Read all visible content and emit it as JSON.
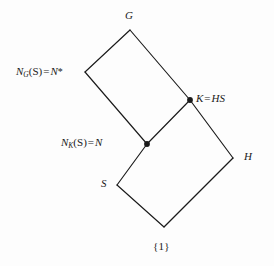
{
  "figure": {
    "type": "subgroup-lattice-diagram",
    "background_color": "#fdfdfd",
    "line_color": "#1a1a1a",
    "text_color": "#1a1a1a",
    "width": 274,
    "height": 266
  },
  "nodes": {
    "top": {
      "id": "G",
      "label": "G",
      "x": 130,
      "y": 30,
      "dot": false
    },
    "upper_left": {
      "id": "N_G_S",
      "label_prefix": "N",
      "label_subscript": "G",
      "label_arg": "(S)",
      "label_operator": "=",
      "label_value": "N",
      "label_star": "*",
      "label_full": "N_G(S) = N*",
      "x": 85,
      "y": 72,
      "dot": false
    },
    "right_upper": {
      "id": "K",
      "label_left": "K",
      "label_operator": "=",
      "label_right": "HS",
      "label_full": "K = HS",
      "x": 190,
      "y": 100,
      "dot": true
    },
    "center": {
      "id": "N_K_S",
      "label_prefix": "N",
      "label_subscript": "K",
      "label_arg": "(S)",
      "label_operator": "=",
      "label_value": "N",
      "label_full": "N_K(S) = N",
      "x": 147,
      "y": 144,
      "dot": true
    },
    "right_lower": {
      "id": "H",
      "label": "H",
      "x": 233,
      "y": 158,
      "dot": false
    },
    "left_lower": {
      "id": "S",
      "label": "S",
      "x": 117,
      "y": 185,
      "dot": false
    },
    "bottom": {
      "id": "one",
      "label": "{1}",
      "x": 164,
      "y": 227,
      "dot": false
    }
  },
  "edges": [
    {
      "from": "G",
      "to": "N_G_S"
    },
    {
      "from": "G",
      "to": "K"
    },
    {
      "from": "N_G_S",
      "to": "N_K_S"
    },
    {
      "from": "K",
      "to": "N_K_S"
    },
    {
      "from": "K",
      "to": "H"
    },
    {
      "from": "N_K_S",
      "to": "S"
    },
    {
      "from": "H",
      "to": "one"
    },
    {
      "from": "S",
      "to": "one"
    }
  ]
}
